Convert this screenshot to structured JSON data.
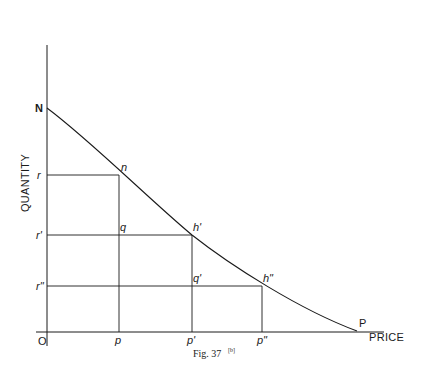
{
  "figure": {
    "caption": "Fig. 37",
    "caption_superscript": "[b]",
    "x_axis_label": "PRICE",
    "y_axis_label": "QUANTITY",
    "origin_label": "O",
    "curve_start_label": "N",
    "curve_end_label": "P",
    "points": [
      {
        "label": "n",
        "x": 119,
        "y": 175
      },
      {
        "label": "h'",
        "x": 192,
        "y": 235
      },
      {
        "label": "h\"",
        "x": 262,
        "y": 286
      }
    ],
    "inner_points": [
      {
        "label": "q",
        "x": 119,
        "y": 235
      },
      {
        "label": "q'",
        "x": 192,
        "y": 286
      }
    ],
    "y_ticks": [
      {
        "label": "r",
        "y": 175
      },
      {
        "label": "r'",
        "y": 235
      },
      {
        "label": "r\"",
        "y": 286
      }
    ],
    "x_ticks": [
      {
        "label": "p",
        "x": 119
      },
      {
        "label": "p'",
        "x": 192
      },
      {
        "label": "p\"",
        "x": 262
      }
    ]
  },
  "colors": {
    "line": "#1a1a1a",
    "background": "#ffffff"
  }
}
